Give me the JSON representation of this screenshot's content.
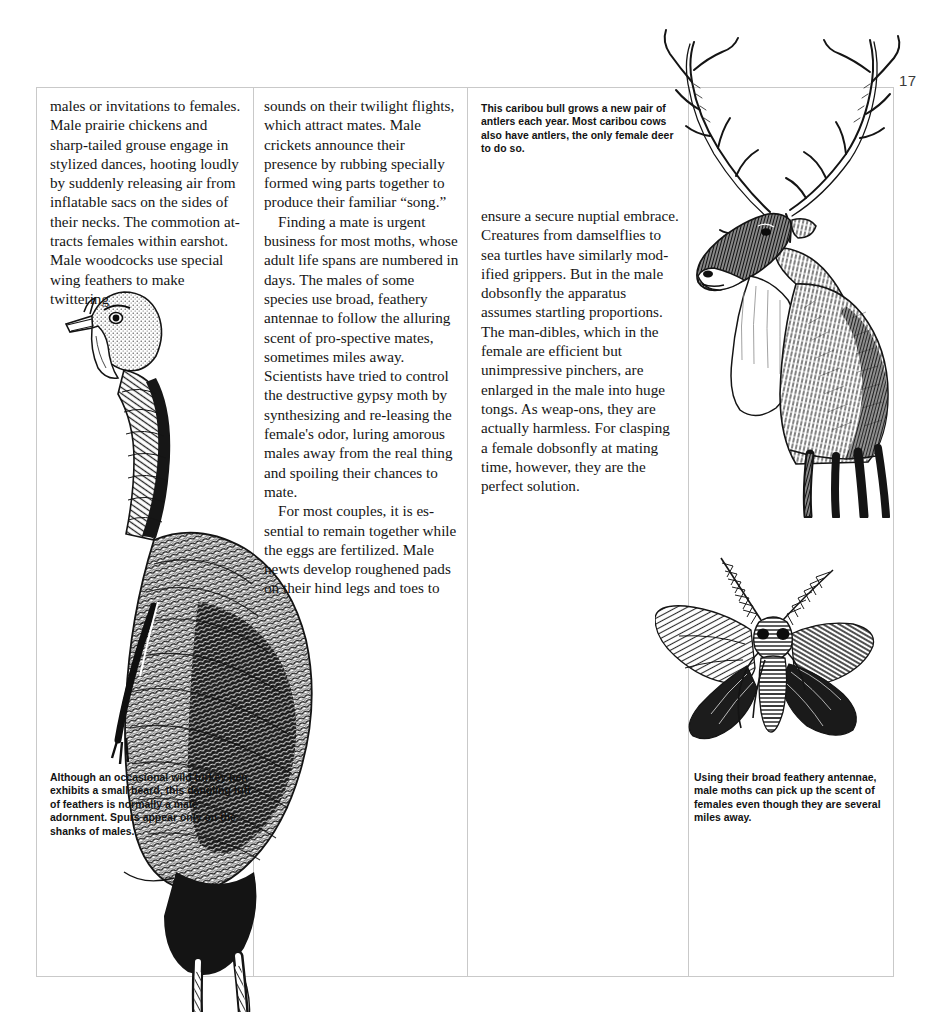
{
  "page": {
    "number": "17"
  },
  "columns": {
    "col1": [
      "males or invitations to females. Male prairie chickens and sharp-tailed grouse engage in stylized dances, hooting loudly by suddenly releasing air from inflatable sacs on the sides of their necks. The commotion at-tracts females within earshot. Male woodcocks use special wing feathers to make twittering"
    ],
    "col2": [
      "sounds on their twilight flights, which attract mates. Male crickets announce their presence by rubbing specially formed wing parts together to produce their familiar “song.”",
      "Finding a mate is urgent business for most moths, whose adult life spans are numbered in days. The males of some species use broad, feathery antennae to follow the alluring scent of pro-spective mates, sometimes miles away. Scientists have tried to control the destructive gypsy moth by synthesizing and re-leasing the female's odor, luring amorous males away from the real thing and spoiling their chances to mate.",
      "For most couples, it is es-sential to remain together while the eggs are fertilized. Male newts develop roughened pads on their hind legs and toes to"
    ],
    "col3": [
      "ensure a secure nuptial embrace. Creatures from damselflies to sea turtles have similarly mod-ified grippers. But in the male dobsonfly the apparatus assumes startling proportions. The man-dibles, which in the female are efficient but unimpressive pinchers, are enlarged in the male into huge tongs. As weap-ons, they are actually harmless. For clasping a female dobsonfly at mating time, however, they are the perfect solution."
    ]
  },
  "captions": {
    "caribou": "This caribou bull grows a new pair of antlers each year. Most caribou cows also have antlers, the only female deer to do so.",
    "turkey": "Although an occasional wild turkey hen exhibits a small beard, this dangling tuft of feathers is normally a male adornment. Spurs appear only on the shanks of males.",
    "moth": "Using their broad feathery antennae, male moths can pick up the scent of females even though they are several miles away."
  },
  "illustrations": {
    "turkey": {
      "subject": "wild turkey",
      "style": "pen-and-ink engraving"
    },
    "caribou": {
      "subject": "caribou bull with antlers",
      "style": "pen-and-ink engraving"
    },
    "moth": {
      "subject": "moth with feathery antennae",
      "style": "pen-and-ink engraving"
    }
  },
  "colors": {
    "page_background": "#ffffff",
    "ink": "#111111",
    "rule": "#c9c9c9"
  }
}
